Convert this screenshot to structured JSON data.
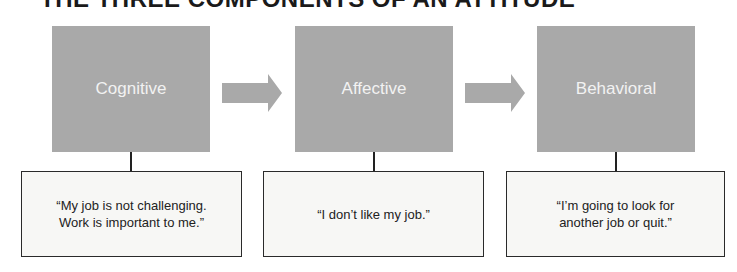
{
  "title": "THE THREE COMPONENTS OF AN ATTITUDE",
  "components": [
    {
      "label": "Cognitive",
      "quote": "“My job is not challenging.\nWork is important to me.”"
    },
    {
      "label": "Affective",
      "quote": "“I don’t like my job.”"
    },
    {
      "label": "Behavioral",
      "quote": "“I’m going to look for\nanother job or quit.”"
    }
  ],
  "colors": {
    "box": "#a9a9a9",
    "arrow": "#a9a9a9",
    "label_text": "#f2f2f2"
  }
}
